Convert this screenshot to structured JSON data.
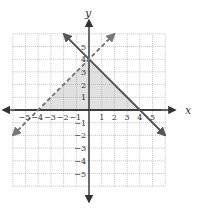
{
  "chart_data": {
    "type": "line",
    "title": "",
    "xlabel": "x",
    "ylabel": "y",
    "xlim": [
      -6,
      6
    ],
    "ylim": [
      -6,
      6
    ],
    "grid": true,
    "x_ticks": [
      -5,
      -4,
      -3,
      -2,
      -1,
      1,
      2,
      3,
      4,
      5
    ],
    "y_ticks": [
      5,
      4,
      3,
      2,
      1,
      -1,
      -2,
      -3,
      -4,
      -5
    ],
    "series": [
      {
        "name": "y = -x + 4",
        "style": "solid",
        "points": [
          [
            -2,
            6
          ],
          [
            6,
            -2
          ]
        ]
      },
      {
        "name": "y = x + 4",
        "style": "dashed",
        "points": [
          [
            -6,
            -2
          ],
          [
            2,
            6
          ]
        ]
      }
    ],
    "shaded_region": {
      "vertices": [
        [
          -4,
          0
        ],
        [
          0,
          4
        ],
        [
          4,
          0
        ]
      ],
      "color": "#e0e0e0"
    }
  },
  "colors": {
    "grid": "#9a9a9a",
    "axis": "#333333",
    "line": "#555555",
    "dashed": "#777777",
    "shade": "#e0e0e0"
  }
}
